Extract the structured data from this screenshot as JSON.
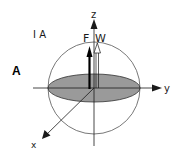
{
  "figure": {
    "panel_label": "A",
    "case_label": "I A",
    "axes": {
      "x": "x",
      "y": "y",
      "z": "z"
    },
    "vectors": [
      {
        "label": "F",
        "style": "solid-filled"
      },
      {
        "label": "W",
        "style": "hollow"
      }
    ],
    "colors": {
      "line": "#1a1a1a",
      "disk_fill": "#9a9a9a",
      "sphere_stroke": "#555555"
    }
  }
}
